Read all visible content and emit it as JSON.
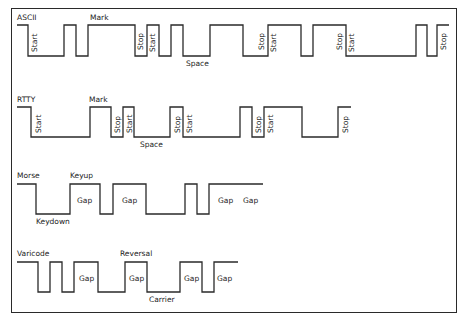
{
  "diagram": {
    "rows": [
      {
        "name": "ASCII",
        "high_y": 25,
        "low_y": 56,
        "points": [
          17,
          28,
          64,
          76,
          88,
          135,
          147,
          159,
          171,
          183,
          210,
          243,
          268,
          301,
          313,
          346,
          416,
          427,
          437,
          449
        ],
        "start_level": "high",
        "labels": [
          {
            "text": "ASCII",
            "x": 17,
            "y": 20,
            "rot": false
          },
          {
            "text": "Mark",
            "x": 90,
            "y": 20,
            "rot": false
          },
          {
            "text": "Space",
            "x": 186,
            "y": 66,
            "rot": false
          },
          {
            "text": "Start",
            "x": 37,
            "y": 52,
            "rot": true
          },
          {
            "text": "Stop",
            "x": 143,
            "y": 50,
            "rot": true
          },
          {
            "text": "Start",
            "x": 155,
            "y": 52,
            "rot": true
          },
          {
            "text": "Stop",
            "x": 264,
            "y": 50,
            "rot": true
          },
          {
            "text": "Start",
            "x": 276,
            "y": 52,
            "rot": true
          },
          {
            "text": "Stop",
            "x": 342,
            "y": 50,
            "rot": true
          },
          {
            "text": "Start",
            "x": 354,
            "y": 52,
            "rot": true
          },
          {
            "text": "Stop",
            "x": 446,
            "y": 50,
            "rot": true
          }
        ]
      },
      {
        "name": "RTTY",
        "high_y": 107,
        "low_y": 137,
        "points": [
          17,
          31,
          90,
          111,
          123,
          134,
          170,
          183,
          240,
          252,
          264,
          302,
          338,
          351
        ],
        "start_level": "high",
        "labels": [
          {
            "text": "RTTY",
            "x": 17,
            "y": 102,
            "rot": false
          },
          {
            "text": "Mark",
            "x": 89,
            "y": 102,
            "rot": false
          },
          {
            "text": "Space",
            "x": 140,
            "y": 147,
            "rot": false
          },
          {
            "text": "Start",
            "x": 41,
            "y": 133,
            "rot": true
          },
          {
            "text": "Stop",
            "x": 120,
            "y": 133,
            "rot": true
          },
          {
            "text": "Start",
            "x": 132,
            "y": 133,
            "rot": true
          },
          {
            "text": "Stop",
            "x": 180,
            "y": 133,
            "rot": true
          },
          {
            "text": "Start",
            "x": 192,
            "y": 133,
            "rot": true
          },
          {
            "text": "Stop",
            "x": 261,
            "y": 133,
            "rot": true
          },
          {
            "text": "Start",
            "x": 273,
            "y": 133,
            "rot": true
          },
          {
            "text": "Stop",
            "x": 348,
            "y": 133,
            "rot": true
          }
        ]
      },
      {
        "name": "Morse",
        "high_y": 184,
        "low_y": 214,
        "points": [
          17,
          36,
          70,
          100,
          113,
          146,
          185,
          197,
          209,
          263
        ],
        "start_level": "high",
        "labels": [
          {
            "text": "Morse",
            "x": 17,
            "y": 178,
            "rot": false
          },
          {
            "text": "Keyup",
            "x": 70,
            "y": 178,
            "rot": false
          },
          {
            "text": "Keydown",
            "x": 36,
            "y": 224,
            "rot": false
          },
          {
            "text": "Gap",
            "x": 77,
            "y": 203,
            "rot": false
          },
          {
            "text": "Gap",
            "x": 122,
            "y": 203,
            "rot": false
          },
          {
            "text": "Gap",
            "x": 218,
            "y": 203,
            "rot": false
          },
          {
            "text": "Gap",
            "x": 243,
            "y": 203,
            "rot": false
          }
        ]
      },
      {
        "name": "Varicode",
        "high_y": 262,
        "low_y": 292,
        "points": [
          17,
          38,
          50,
          62,
          74,
          98,
          125,
          147,
          180,
          202,
          214,
          238
        ],
        "start_level": "high",
        "labels": [
          {
            "text": "Varicode",
            "x": 17,
            "y": 256,
            "rot": false
          },
          {
            "text": "Reversal",
            "x": 120,
            "y": 256,
            "rot": false
          },
          {
            "text": "Carrier",
            "x": 149,
            "y": 302,
            "rot": false
          },
          {
            "text": "Gap",
            "x": 79,
            "y": 281,
            "rot": false
          },
          {
            "text": "Gap",
            "x": 129,
            "y": 281,
            "rot": false
          },
          {
            "text": "Gap",
            "x": 184,
            "y": 281,
            "rot": false
          },
          {
            "text": "Gap",
            "x": 217,
            "y": 281,
            "rot": false
          }
        ]
      }
    ]
  }
}
